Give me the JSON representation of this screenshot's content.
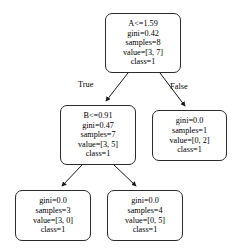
{
  "diagram": {
    "type": "decision-tree",
    "nodes": [
      {
        "id": "root",
        "lines": [
          "A<=1.59",
          "gini=0.42",
          "samples=8",
          "value=[3, 7]",
          "class=1"
        ],
        "feature": "A",
        "threshold": 1.59,
        "gini": 0.42,
        "samples": 8,
        "value": [
          3,
          7
        ],
        "class": "1"
      },
      {
        "id": "left",
        "lines": [
          "B<=0.91",
          "gini=0.47",
          "samples=7",
          "value=[3, 5]",
          "class=1"
        ],
        "feature": "B",
        "threshold": 0.91,
        "gini": 0.47,
        "samples": 7,
        "value": [
          3,
          5
        ],
        "class": "1"
      },
      {
        "id": "right",
        "lines": [
          "gini=0.0",
          "samples=1",
          "value=[0, 2]",
          "class=1"
        ],
        "gini": 0.0,
        "samples": 1,
        "value": [
          0,
          2
        ],
        "class": "1"
      },
      {
        "id": "leaf-ll",
        "lines": [
          "gini=0.0",
          "samples=3",
          "value=[3, 0]",
          "class=1"
        ],
        "gini": 0.0,
        "samples": 3,
        "value": [
          3,
          0
        ],
        "class": "1"
      },
      {
        "id": "leaf-lr",
        "lines": [
          "gini=0.0",
          "samples=4",
          "value=[0, 5]",
          "class=1"
        ],
        "gini": 0.0,
        "samples": 4,
        "value": [
          0,
          5
        ],
        "class": "1"
      }
    ],
    "edge_labels": {
      "true_label": "True",
      "false_label": "False"
    },
    "colors": {
      "node_border": "#2b2b2b",
      "node_fill": "#ffffff",
      "edge_stroke": "#1a1a1a",
      "text": "#000000",
      "background": "#ffffff"
    }
  }
}
